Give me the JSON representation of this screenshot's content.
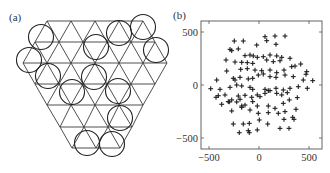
{
  "figure": {
    "panel_a": {
      "label": "(a)",
      "description": "Triangular lattice with circles placed at lattice sites",
      "lattice": {
        "rows_y": [
          21,
          42,
          63,
          84,
          105,
          127,
          148
        ],
        "rows_x_range": [
          [
            47,
            143
          ],
          [
            35,
            155
          ],
          [
            23,
            167
          ],
          [
            35,
            155
          ],
          [
            47,
            143
          ],
          [
            60,
            132
          ],
          [
            72,
            120
          ]
        ],
        "side": 24
      },
      "circles": [
        {
          "cx": 41,
          "cy": 37,
          "r": 12.5
        },
        {
          "cx": 29,
          "cy": 60,
          "r": 12.5
        },
        {
          "cx": 48,
          "cy": 76,
          "r": 12.5
        },
        {
          "cx": 72,
          "cy": 92,
          "r": 12.5
        },
        {
          "cx": 96,
          "cy": 47,
          "r": 12.5
        },
        {
          "cx": 94,
          "cy": 77,
          "r": 12.5
        },
        {
          "cx": 119,
          "cy": 33,
          "r": 12.5
        },
        {
          "cx": 143,
          "cy": 27,
          "r": 12.5
        },
        {
          "cx": 156,
          "cy": 50,
          "r": 12.5
        },
        {
          "cx": 118,
          "cy": 91,
          "r": 12.5
        },
        {
          "cx": 120,
          "cy": 118,
          "r": 12.5
        },
        {
          "cx": 87,
          "cy": 143,
          "r": 12.5
        },
        {
          "cx": 112,
          "cy": 144,
          "r": 12.5
        }
      ]
    },
    "panel_b": {
      "label": "(b)",
      "x_ticks": [
        {
          "value": -500,
          "label": "-500"
        },
        {
          "value": 0,
          "label": "0"
        },
        {
          "value": 500,
          "label": "500"
        }
      ],
      "y_ticks": [
        {
          "value": 500,
          "label": "500"
        },
        {
          "value": 0,
          "label": "0"
        },
        {
          "value": -500,
          "label": "-500"
        }
      ]
    }
  },
  "chart_data": {
    "type": "scatter",
    "title": "",
    "panel": "(b)",
    "xlabel": "",
    "ylabel": "",
    "xlim": [
      -580,
      630
    ],
    "ylim": [
      -600,
      610
    ],
    "x_ticks": [
      -500,
      0,
      500
    ],
    "y_ticks": [
      -500,
      0,
      500
    ],
    "marker": "+",
    "grid": false,
    "legend": null,
    "points": [
      [
        -247,
        415
      ],
      [
        -157,
        415
      ],
      [
        160,
        462
      ],
      [
        60,
        456
      ],
      [
        260,
        462
      ],
      [
        77,
        418
      ],
      [
        170,
        384
      ],
      [
        -23,
        377
      ],
      [
        -290,
        336
      ],
      [
        -273,
        324
      ],
      [
        -207,
        340
      ],
      [
        -140,
        277
      ],
      [
        -90,
        283
      ],
      [
        -57,
        274
      ],
      [
        -17,
        261
      ],
      [
        43,
        267
      ],
      [
        110,
        283
      ],
      [
        177,
        274
      ],
      [
        227,
        261
      ],
      [
        -330,
        236
      ],
      [
        -240,
        217
      ],
      [
        -173,
        214
      ],
      [
        -117,
        211
      ],
      [
        -63,
        204
      ],
      [
        77,
        236
      ],
      [
        143,
        220
      ],
      [
        210,
        229
      ],
      [
        310,
        252
      ],
      [
        -323,
        132
      ],
      [
        -183,
        148
      ],
      [
        -117,
        154
      ],
      [
        -40,
        141
      ],
      [
        27,
        135
      ],
      [
        110,
        141
      ],
      [
        177,
        116
      ],
      [
        250,
        141
      ],
      [
        327,
        173
      ],
      [
        360,
        179
      ],
      [
        417,
        198
      ],
      [
        477,
        126
      ],
      [
        470,
        101
      ],
      [
        -257,
        63
      ],
      [
        -240,
        47
      ],
      [
        -190,
        72
      ],
      [
        -107,
        57
      ],
      [
        -63,
        63
      ],
      [
        -7,
        94
      ],
      [
        43,
        104
      ],
      [
        110,
        79
      ],
      [
        170,
        72
      ],
      [
        260,
        94
      ],
      [
        343,
        79
      ],
      [
        443,
        47
      ],
      [
        537,
        41
      ],
      [
        -423,
        47
      ],
      [
        -483,
        -35
      ],
      [
        -390,
        -41
      ],
      [
        -290,
        -22
      ],
      [
        -223,
        0
      ],
      [
        -173,
        -9
      ],
      [
        -90,
        -22
      ],
      [
        -63,
        -41
      ],
      [
        60,
        -41
      ],
      [
        93,
        -53
      ],
      [
        170,
        -31
      ],
      [
        243,
        -47
      ],
      [
        310,
        -31
      ],
      [
        393,
        -16
      ],
      [
        483,
        -31
      ],
      [
        -430,
        -116
      ],
      [
        -407,
        -101
      ],
      [
        -340,
        -94
      ],
      [
        -297,
        -160
      ],
      [
        -273,
        -141
      ],
      [
        -207,
        -104
      ],
      [
        -190,
        -135
      ],
      [
        -140,
        -97
      ],
      [
        -73,
        -116
      ],
      [
        -17,
        -94
      ],
      [
        10,
        -110
      ],
      [
        60,
        -79
      ],
      [
        110,
        -53
      ],
      [
        177,
        -79
      ],
      [
        227,
        -94
      ],
      [
        283,
        -72
      ],
      [
        303,
        -141
      ],
      [
        383,
        -119
      ],
      [
        -373,
        -182
      ],
      [
        -307,
        -157
      ],
      [
        -223,
        -160
      ],
      [
        -173,
        -198
      ],
      [
        -140,
        -189
      ],
      [
        -63,
        -157
      ],
      [
        -17,
        -198
      ],
      [
        93,
        -198
      ],
      [
        160,
        -220
      ],
      [
        243,
        -173
      ],
      [
        370,
        -229
      ],
      [
        -273,
        -245
      ],
      [
        -173,
        -211
      ],
      [
        -90,
        -236
      ],
      [
        -7,
        -267
      ],
      [
        93,
        -261
      ],
      [
        193,
        -267
      ],
      [
        260,
        -251
      ],
      [
        -257,
        -368
      ],
      [
        -157,
        -368
      ],
      [
        -97,
        -362
      ],
      [
        3,
        -330
      ],
      [
        87,
        -368
      ],
      [
        250,
        -324
      ],
      [
        337,
        -305
      ],
      [
        350,
        -324
      ],
      [
        -197,
        -450
      ],
      [
        -107,
        -431
      ],
      [
        -97,
        -450
      ],
      [
        -17,
        -424
      ],
      [
        210,
        -409
      ],
      [
        300,
        -409
      ]
    ]
  }
}
